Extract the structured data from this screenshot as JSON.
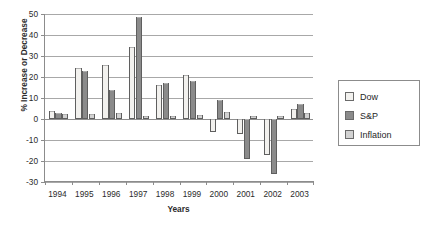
{
  "chart_data": {
    "type": "bar",
    "title": "",
    "xlabel": "Years",
    "ylabel": "% Increase or Decrease",
    "categories": [
      "1994",
      "1995",
      "1996",
      "1997",
      "1998",
      "1999",
      "2000",
      "2001",
      "2002",
      "2003"
    ],
    "series": [
      {
        "name": "Dow",
        "color": "#f2f1ee",
        "values": [
          4,
          24.5,
          25.5,
          34.5,
          16,
          21,
          -6,
          -7,
          -17,
          5
        ]
      },
      {
        "name": "S&P",
        "color": "#8b8b8b",
        "values": [
          3,
          23,
          14,
          48.5,
          17,
          18,
          9,
          -19,
          -26,
          7
        ]
      },
      {
        "name": "Inflation",
        "color": "#d2d2d2",
        "values": [
          2.5,
          2.5,
          3,
          1.5,
          1.5,
          2,
          3.5,
          1.5,
          1.5,
          3
        ]
      }
    ],
    "ylim": [
      -30,
      50
    ],
    "ytick_labels": [
      "50",
      "40",
      "30",
      "20",
      "10",
      "0",
      "-10",
      "-20",
      "-30"
    ],
    "ytick_values": [
      50,
      40,
      30,
      20,
      10,
      0,
      -10,
      -20,
      -30
    ],
    "grid": true,
    "legend_position": "right"
  },
  "legend": {
    "items": [
      {
        "label": "Dow"
      },
      {
        "label": "S&P"
      },
      {
        "label": "Inflation"
      }
    ]
  }
}
